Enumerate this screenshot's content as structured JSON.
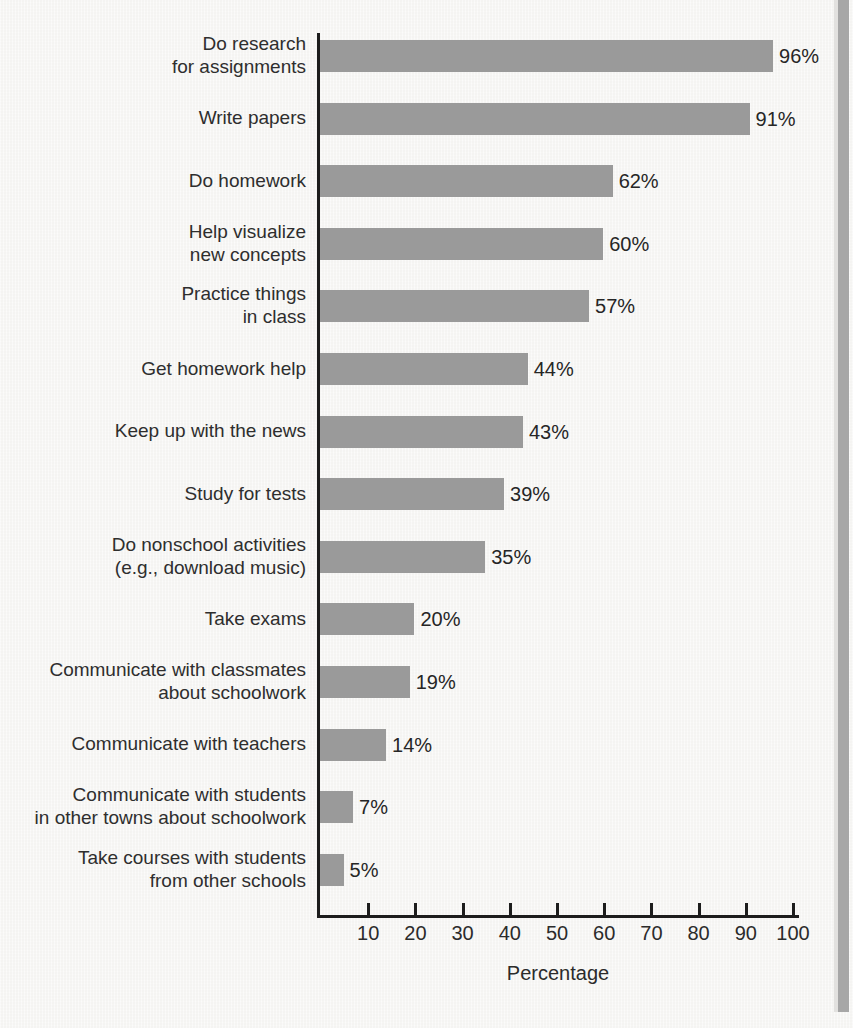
{
  "chart_data": {
    "type": "bar",
    "orientation": "horizontal",
    "title": "",
    "xlabel": "Percentage",
    "ylabel": "",
    "xlim": [
      0,
      110
    ],
    "grid": false,
    "legend": null,
    "bar_color": "#9a9a9a",
    "axis_color": "#1d1d1d",
    "text_color": "#2b2b2b",
    "background_color": "#f2f1ef",
    "xticks": [
      10,
      20,
      30,
      40,
      50,
      60,
      70,
      80,
      90,
      100
    ],
    "xtick_labels": [
      "10",
      "20",
      "30",
      "40",
      "50",
      "60",
      "70",
      "80",
      "90",
      "100"
    ],
    "categories": [
      "Do research\nfor assignments",
      "Write papers",
      "Do homework",
      "Help visualize\nnew concepts",
      "Practice things\nin class",
      "Get homework help",
      "Keep up with the news",
      "Study for tests",
      "Do nonschool activities\n(e.g., download music)",
      "Take exams",
      "Communicate with classmates\nabout schoolwork",
      "Communicate with teachers",
      "Communicate with students\nin other towns about schoolwork",
      "Take courses with students\nfrom other schools"
    ],
    "values": [
      96,
      91,
      62,
      60,
      57,
      44,
      43,
      39,
      35,
      20,
      19,
      14,
      7,
      5
    ],
    "value_labels": [
      "96%",
      "91%",
      "62%",
      "60%",
      "57%",
      "44%",
      "43%",
      "39%",
      "35%",
      "20%",
      "19%",
      "14%",
      "7%",
      "5%"
    ]
  }
}
